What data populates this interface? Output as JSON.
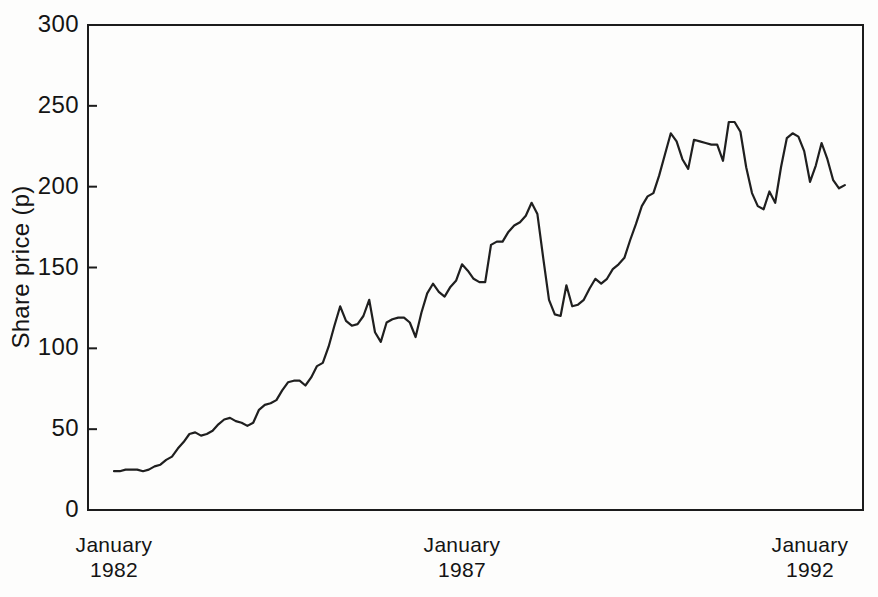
{
  "chart_data": {
    "type": "line",
    "title": "",
    "ylabel": "Share price (p)",
    "xlabel": "",
    "ylim": [
      0,
      300
    ],
    "y_ticks": [
      0,
      50,
      100,
      150,
      200,
      250,
      300
    ],
    "x_ticks": [
      {
        "month": "January",
        "year": "1982",
        "index": 0
      },
      {
        "month": "January",
        "year": "1987",
        "index": 60
      },
      {
        "month": "January",
        "year": "1992",
        "index": 120
      }
    ],
    "grid": false,
    "legend": false,
    "colors": {
      "line": "#1f1f1f",
      "axis": "#1c1c1c",
      "text": "#141414",
      "background": "#fdfdfc"
    },
    "series": [
      {
        "name": "Share price",
        "cadence": "monthly",
        "start_label": "January 1982",
        "values": [
          24,
          24,
          25,
          25,
          25,
          24,
          25,
          27,
          28,
          31,
          33,
          38,
          42,
          47,
          48,
          46,
          47,
          49,
          53,
          56,
          57,
          55,
          54,
          52,
          54,
          62,
          65,
          66,
          68,
          74,
          79,
          80,
          80,
          77,
          82,
          89,
          91,
          101,
          114,
          126,
          117,
          114,
          115,
          120,
          130,
          110,
          104,
          116,
          118,
          119,
          119,
          116,
          107,
          122,
          134,
          140,
          135,
          132,
          138,
          142,
          152,
          148,
          143,
          141,
          141,
          164,
          166,
          166,
          172,
          176,
          178,
          182,
          190,
          183,
          156,
          130,
          121,
          120,
          139,
          126,
          127,
          130,
          137,
          143,
          140,
          143,
          149,
          152,
          156,
          167,
          177,
          188,
          194,
          196,
          207,
          220,
          233,
          228,
          217,
          211,
          229,
          228,
          227,
          226,
          226,
          216,
          240,
          240,
          234,
          212,
          196,
          188,
          186,
          197,
          190,
          212,
          230,
          233,
          231,
          222,
          203,
          213,
          227,
          217,
          204,
          199,
          201
        ]
      }
    ]
  }
}
